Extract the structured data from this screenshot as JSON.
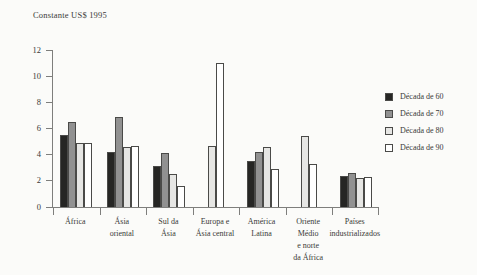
{
  "chart_data": {
    "type": "bar",
    "title": "Constante US$ 1995",
    "categories": [
      "África",
      "Ásia\noriental",
      "Sul da\nÁsia",
      "Europa e\nÁsia central",
      "América\nLatina",
      "Oriente\nMédio\ne norte\nda África",
      "Países\nindustrializados"
    ],
    "series": [
      {
        "name": "Década de 60",
        "color": "#262624",
        "values": [
          5.5,
          4.2,
          3.1,
          null,
          3.5,
          null,
          2.4
        ]
      },
      {
        "name": "Década de 70",
        "color": "#919191",
        "values": [
          6.5,
          6.9,
          4.1,
          null,
          4.2,
          null,
          2.6
        ]
      },
      {
        "name": "Década de 80",
        "color": "#e6e6e4",
        "values": [
          4.9,
          4.6,
          2.5,
          4.7,
          4.6,
          5.4,
          2.2
        ]
      },
      {
        "name": "Década de 90",
        "color": "#ffffff",
        "values": [
          4.9,
          4.7,
          1.6,
          11.0,
          2.9,
          3.3,
          2.3
        ]
      }
    ],
    "ylabel": "",
    "xlabel": "",
    "ylim": [
      0,
      12
    ],
    "yticks": [
      0,
      2,
      4,
      6,
      8,
      10,
      12
    ],
    "grid": false,
    "legend_position": "right",
    "axis_color": "#7e7e7c"
  }
}
